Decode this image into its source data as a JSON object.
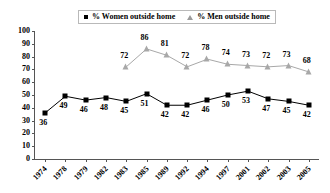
{
  "legend": {
    "entries": [
      {
        "label": "% Women outside home",
        "marker": "square-marker",
        "color": "#000000"
      },
      {
        "label": "% Men outside home",
        "marker": "triangle-marker",
        "color": "#a8a8a8"
      }
    ]
  },
  "chart_data": {
    "type": "line",
    "title": "",
    "xlabel": "",
    "ylabel": "",
    "ylim": [
      0,
      100
    ],
    "ytick_step": 10,
    "yticks": [
      0,
      10,
      20,
      30,
      40,
      50,
      60,
      70,
      80,
      90,
      100
    ],
    "grid": false,
    "legend_position": "top",
    "categories": [
      "1974",
      "1978",
      "1979",
      "1982",
      "1983",
      "1985",
      "1989",
      "1992",
      "1994",
      "1997",
      "2001",
      "2002",
      "2003",
      "2005"
    ],
    "series": [
      {
        "name": "% Women outside home",
        "marker": "square",
        "color": "#000000",
        "values": [
          36,
          49,
          46,
          48,
          45,
          51,
          42,
          42,
          46,
          50,
          53,
          47,
          45,
          42
        ]
      },
      {
        "name": "% Men outside home",
        "marker": "triangle",
        "color": "#a8a8a8",
        "values": [
          null,
          null,
          null,
          null,
          72,
          86,
          81,
          72,
          78,
          74,
          73,
          72,
          73,
          68
        ]
      }
    ]
  }
}
